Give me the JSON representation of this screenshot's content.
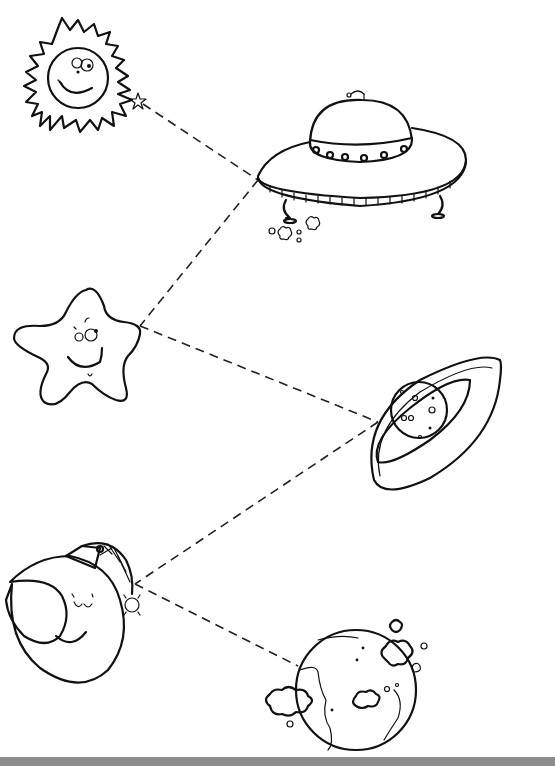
{
  "worksheet": {
    "type": "trace-the-lines",
    "theme": "space",
    "title_visible": false,
    "colors": {
      "ink": "#111111",
      "background": "#ffffff",
      "footer_bar": "#8c8c8c"
    },
    "left_items": [
      {
        "name": "sun",
        "face": "smiling with big eyes",
        "position": [
          80,
          85
        ]
      },
      {
        "name": "star",
        "face": "smiling, looking up",
        "position": [
          70,
          350
        ]
      },
      {
        "name": "moon",
        "face": "sleeping crescent moon with striped night cap",
        "position": [
          65,
          640
        ]
      }
    ],
    "right_items": [
      {
        "name": "flying-saucer",
        "detail": "UFO with dome, antenna, portholes, legs, exhaust puffs",
        "position": [
          370,
          165
        ]
      },
      {
        "name": "ringed-planet",
        "detail": "Saturn-like planet with crater dots and tilted ring",
        "position": [
          430,
          420
        ]
      },
      {
        "name": "earth-globe",
        "detail": "globe with continents and clouds",
        "position": [
          360,
          695
        ]
      }
    ],
    "trace_lines": [
      {
        "from": "sun-star-tip",
        "to": "flying-saucer",
        "points": [
          [
            140,
            102
          ],
          [
            258,
            180
          ]
        ]
      },
      {
        "from": "flying-saucer",
        "to": "star",
        "points": [
          [
            258,
            180
          ],
          [
            140,
            325
          ]
        ]
      },
      {
        "from": "star",
        "to": "ringed-planet",
        "points": [
          [
            140,
            325
          ],
          [
            378,
            422
          ]
        ]
      },
      {
        "from": "ringed-planet",
        "to": "moon",
        "points": [
          [
            378,
            422
          ],
          [
            135,
            583
          ]
        ]
      },
      {
        "from": "moon",
        "to": "earth-globe",
        "points": [
          [
            135,
            583
          ],
          [
            298,
            666
          ]
        ]
      }
    ],
    "start_marker": "small-star"
  }
}
